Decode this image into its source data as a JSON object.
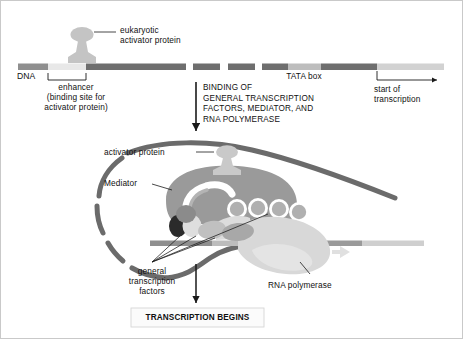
{
  "figure": {
    "colors": {
      "dna_dark": "#6e6e6e",
      "dna_mid": "#8f8f8f",
      "dna_light": "#bdbdbd",
      "dna_pale": "#d2d2d2",
      "enhancer_fill": "#e8e8e8",
      "loop_stroke": "#6b6b6b",
      "activator": "#c4c4c4",
      "mediator": "#9a9a9a",
      "mediator_inner": "#b4b4b4",
      "gtf_dark": "#2b2b2b",
      "gtf_light": "#dedede",
      "gtf_mid": "#a8a8a8",
      "polymerase": "#d8d8d8",
      "text": "#111111"
    }
  },
  "top_panel": {
    "activator_label": "eukaryotic\nactivator protein",
    "dna_label": "DNA",
    "enhancer_label": "enhancer\n(binding site for\nactivator protein)",
    "tata_label": "TATA box",
    "start_label": "start of\ntranscription"
  },
  "process_arrow": {
    "text": "BINDING OF\nGENERAL TRANSCRIPTION\nFACTORS, MEDIATOR, AND\nRNA POLYMERASE"
  },
  "bottom_panel": {
    "activator_label": "activator protein",
    "mediator_label": "Mediator",
    "gtf_label": "general\ntranscription\nfactors",
    "polymerase_label": "RNA polymerase"
  },
  "result_box": {
    "text": "TRANSCRIPTION BEGINS"
  }
}
